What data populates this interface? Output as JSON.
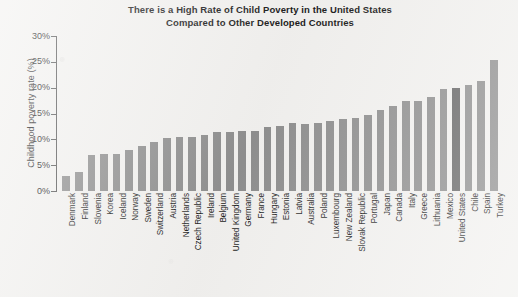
{
  "chart_data": {
    "type": "bar",
    "title": "There is a High Rate of Child Poverty in the United States Compared to Other Developed Countries",
    "title_line1": "There is a High Rate of Child Poverty in the United States",
    "title_line2": "Compared to Other Developed Countries",
    "xlabel": "",
    "ylabel": "Childhood poverty rate (%)",
    "ylim": [
      0,
      30
    ],
    "ytick_labels": [
      "0%",
      "5%",
      "10%",
      "15%",
      "20%",
      "25%",
      "30%"
    ],
    "ytick_values": [
      0,
      5,
      10,
      15,
      20,
      25,
      30
    ],
    "grid": false,
    "legend": "none",
    "bar_color": "#8f8f8f",
    "highlight_color": "#666666",
    "highlight_category": "United States",
    "categories": [
      "Denmark",
      "Finland",
      "Slovenia",
      "Korea",
      "Iceland",
      "Norway",
      "Sweden",
      "Switzerland",
      "Austria",
      "Netherlands",
      "Czech Republic",
      "Ireland",
      "Belgium",
      "United Kingdom",
      "Germany",
      "France",
      "Hungary",
      "Estonia",
      "Latvia",
      "Australia",
      "Poland",
      "Luxembourg",
      "New Zealand",
      "Slovak Republic",
      "Portugal",
      "Japan",
      "Canada",
      "Italy",
      "Greece",
      "Lithuania",
      "Mexico",
      "United States",
      "Chile",
      "Spain",
      "Turkey"
    ],
    "values": [
      3.0,
      3.6,
      6.9,
      7.1,
      7.1,
      8.0,
      8.8,
      9.5,
      10.2,
      10.5,
      10.5,
      10.8,
      11.4,
      11.4,
      11.6,
      11.7,
      12.3,
      12.5,
      13.1,
      13.0,
      13.2,
      13.6,
      14.0,
      14.1,
      14.8,
      15.7,
      16.4,
      17.5,
      17.5,
      18.1,
      19.8,
      20.0,
      20.5,
      21.2,
      25.3
    ]
  }
}
